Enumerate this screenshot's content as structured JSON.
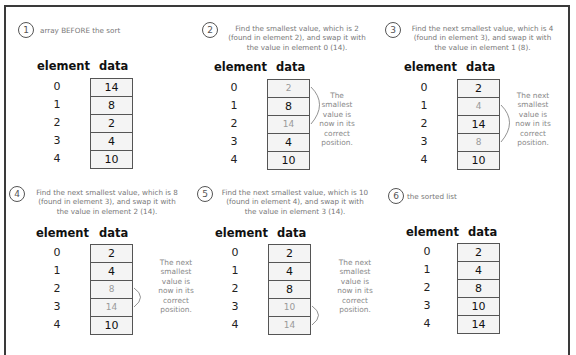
{
  "headers": {
    "element": "element",
    "data": "data"
  },
  "panels": [
    {
      "step": "1",
      "description": "array BEFORE the sort",
      "indices": [
        "0",
        "1",
        "2",
        "3",
        "4"
      ],
      "values": [
        "14",
        "8",
        "2",
        "4",
        "10"
      ],
      "highlighted": [],
      "note": ""
    },
    {
      "step": "2",
      "description_lines": [
        "Find the smallest value, which is 2",
        "(found in element 2), and swap it with",
        "the value in element 0 (14)."
      ],
      "indices": [
        "0",
        "1",
        "2",
        "3",
        "4"
      ],
      "values": [
        "2",
        "8",
        "14",
        "4",
        "10"
      ],
      "highlighted": [
        0,
        2
      ],
      "note_lines": [
        "The",
        "smallest",
        "value is",
        "now in its",
        "correct",
        "position."
      ]
    },
    {
      "step": "3",
      "description_lines": [
        "Find the next smallest value, which is 4",
        "(found in element 3), and swap it with",
        "the value in element 1 (8)."
      ],
      "indices": [
        "0",
        "1",
        "2",
        "3",
        "4"
      ],
      "values": [
        "2",
        "4",
        "14",
        "8",
        "10"
      ],
      "highlighted": [
        1,
        3
      ],
      "note_lines": [
        "The next",
        "smallest",
        "value is",
        "now in its",
        "correct",
        "position."
      ]
    },
    {
      "step": "4",
      "description_lines": [
        "Find the next smallest value, which is 8",
        "(found in element 3), and swap it with",
        "the value in element 2 (14)."
      ],
      "indices": [
        "0",
        "1",
        "2",
        "3",
        "4"
      ],
      "values": [
        "2",
        "4",
        "8",
        "14",
        "10"
      ],
      "highlighted": [
        2,
        3
      ],
      "note_lines": [
        "The next",
        "smallest",
        "value is",
        "now in its",
        "correct",
        "position."
      ]
    },
    {
      "step": "5",
      "description_lines": [
        "Find the next smallest value, which is 10",
        "(found in element 4), and swap it with",
        "the value in element 3 (14)."
      ],
      "indices": [
        "0",
        "1",
        "2",
        "3",
        "4"
      ],
      "values": [
        "2",
        "4",
        "8",
        "10",
        "14"
      ],
      "highlighted": [
        3,
        4
      ],
      "note_lines": [
        "The next",
        "smallest",
        "value is",
        "now in its",
        "correct",
        "position."
      ]
    },
    {
      "step": "6",
      "description": "the sorted list",
      "indices": [
        "0",
        "1",
        "2",
        "3",
        "4"
      ],
      "values": [
        "2",
        "4",
        "8",
        "10",
        "14"
      ],
      "highlighted": [],
      "note": ""
    }
  ],
  "colors": {
    "frame": "#3a3a3a",
    "cell_fill": "#f4f4f4",
    "cell_border": "#555555",
    "dim_text": "#9a9a9a",
    "note_text": "#888888"
  }
}
